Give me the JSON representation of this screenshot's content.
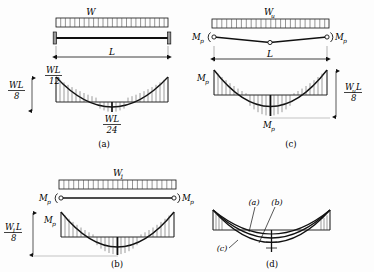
{
  "figure": {
    "background": "#fdfdfd",
    "line_color": "#101010",
    "hatch_color": "#303030",
    "width": 374,
    "height": 272
  },
  "panels": [
    {
      "id": "a",
      "caption": "(a)",
      "load_label": "W",
      "span_label": "L",
      "beam_type": "fixed-fixed elastic beam",
      "moment_labels": [
        {
          "name": "end-moment",
          "numerator": "WL",
          "denominator": "12"
        },
        {
          "name": "total-depth",
          "numerator": "WL",
          "denominator": "8"
        },
        {
          "name": "mid-moment",
          "numerator": "WL",
          "denominator": "24"
        }
      ]
    },
    {
      "id": "c",
      "caption": "(c)",
      "load_label": "W",
      "load_sub": "u",
      "span_label": "L",
      "beam_type": "collapse mechanism with plastic hinges",
      "hinge_labels": [
        "M",
        "M"
      ],
      "hinge_sub": "p",
      "moment_labels": [
        {
          "name": "end-plastic-moment",
          "base": "M",
          "sub": "p"
        },
        {
          "name": "mid-plastic-moment",
          "base": "M",
          "sub": "p"
        },
        {
          "name": "free-moment",
          "numerator": "W",
          "numerator_sub": "u",
          "numerator_tail": "L",
          "denominator": "8"
        }
      ]
    },
    {
      "id": "b",
      "caption": "(b)",
      "load_label": "W",
      "load_sub": "1",
      "beam_type": "first plastic hinges formed at supports",
      "hinge_labels": [
        "M",
        "M"
      ],
      "hinge_sub": "p",
      "moment_labels": [
        {
          "name": "end-plastic-moment",
          "base": "M",
          "sub": "p"
        },
        {
          "name": "free-moment",
          "numerator": "W",
          "numerator_sub": "1",
          "numerator_tail": "L",
          "denominator": "8"
        }
      ]
    },
    {
      "id": "d",
      "caption": "(d)",
      "beam_type": "superimposed moment diagrams",
      "curve_labels": [
        "(a)",
        "(b)",
        "(c)"
      ]
    }
  ],
  "captions": {
    "a": "(a)",
    "b": "(b)",
    "c": "(c)",
    "d": "(d)"
  },
  "symbols": {
    "W": "W",
    "W_u": "Wu",
    "W_1": "W1",
    "L": "L",
    "M_p": "Mp",
    "WL_12": "WL/12",
    "WL_8": "WL/8",
    "WL_24": "WL/24",
    "WuL_8": "WuL/8",
    "W1L_8": "W1L/8"
  }
}
